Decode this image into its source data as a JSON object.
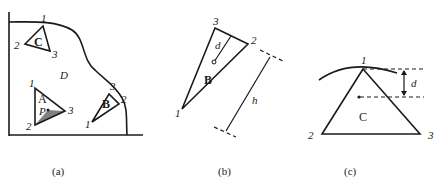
{
  "panels": {
    "a": {
      "caption": "(a)",
      "region_label": "D",
      "triangles": {
        "A": {
          "label": "A",
          "point_label": "P",
          "vertices": [
            "1",
            "2",
            "3"
          ]
        },
        "B": {
          "label": "B",
          "vertices": [
            "1",
            "2",
            "3"
          ]
        },
        "C": {
          "label": "C",
          "vertices": [
            "1",
            "2",
            "3"
          ]
        }
      }
    },
    "b": {
      "caption": "(b)",
      "triangle_label": "B",
      "vertices": [
        "1",
        "2",
        "3"
      ],
      "distance_label": "d",
      "height_label": "h"
    },
    "c": {
      "caption": "(c)",
      "triangle_label": "C",
      "vertices": [
        "1",
        "2",
        "3"
      ],
      "distance_label": "d"
    }
  }
}
